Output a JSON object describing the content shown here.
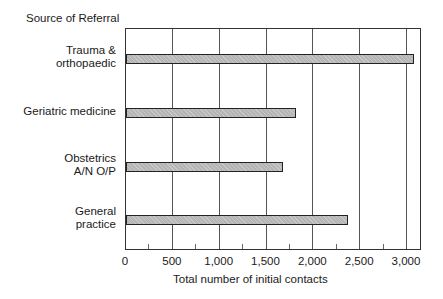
{
  "chart_data": {
    "type": "bar",
    "orientation": "horizontal",
    "title": "Source of Referral",
    "xlabel": "Total number of initial contacts",
    "ylabel": "Source of Referral",
    "categories": [
      "Trauma &\northopaedic",
      "Geriatric medicine",
      "Obstetrics\nA/N O/P",
      "General\npractice"
    ],
    "values": [
      3070,
      1820,
      1680,
      2370
    ],
    "xlim": [
      0,
      3160
    ],
    "xticks": [
      0,
      500,
      1000,
      1500,
      2000,
      2500,
      3000
    ],
    "xtick_labels": [
      "0",
      "500",
      "1,000",
      "1,500",
      "2,000",
      "2,500",
      "3,000"
    ],
    "grid": true,
    "legend": null,
    "bar_color": "#b5b5b5"
  }
}
